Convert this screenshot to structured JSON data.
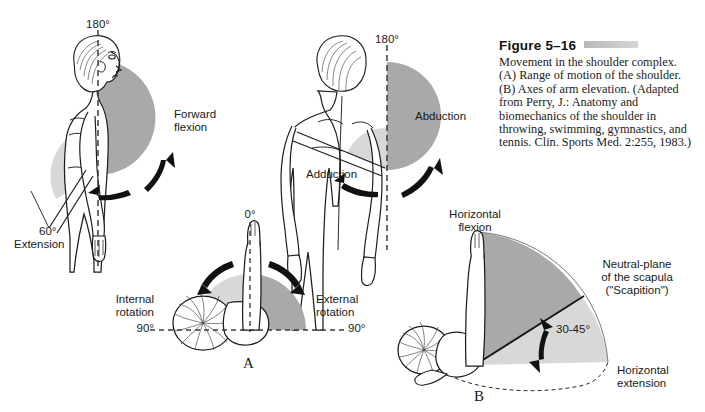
{
  "figure": {
    "title": "Figure 5–16",
    "caption": "Movement in the shoulder complex. (A) Range of motion of the shoulder. (B) Axes of arm elevation. (Adapted from Perry, J.: Anatomy and biomechanics of the shoulder in throwing, swimming, gymnastics, and tennis. Clin. Sports Med. 2:255, 1983.)"
  },
  "panels": {
    "a_letter": "A",
    "b_letter": "B"
  },
  "sagittal": {
    "top_angle": "180°",
    "forward_flexion_line1": "Forward",
    "forward_flexion_line2": "flexion",
    "extension_angle": "60°",
    "extension_label": "Extension"
  },
  "frontal": {
    "top_angle": "180°",
    "abduction": "Abduction",
    "adduction": "Adduction"
  },
  "rotation": {
    "top_angle": "0°",
    "internal_line1": "Internal",
    "internal_line2": "rotation",
    "internal_angle": "90°",
    "external_line1": "External",
    "external_line2": "rotation",
    "external_angle": "90°"
  },
  "transverse": {
    "horizontal_flexion_line1": "Horizontal",
    "horizontal_flexion_line2": "flexion",
    "scapula_line1": "Neutral-plane",
    "scapula_line2": "of the scapula",
    "scapula_line3": "(\"Scapition\")",
    "scaption_angle": "30-45°",
    "horizontal_extension_line1": "Horizontal",
    "horizontal_extension_line2": "extension"
  },
  "colors": {
    "background": "#ffffff",
    "ink": "#1a1a1a",
    "shade_dark": "#a9a9a9",
    "shade_light": "#d8d8d8",
    "rule": "#c2c2c2"
  }
}
